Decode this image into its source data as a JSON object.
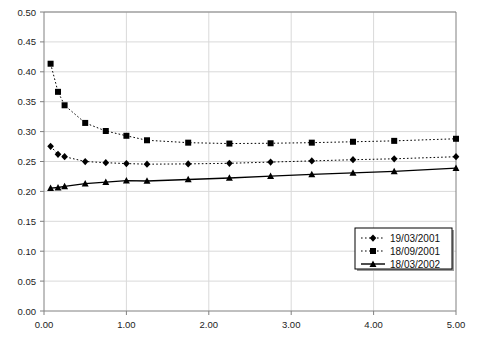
{
  "chart_data": {
    "type": "line",
    "title": "",
    "subtitle": "",
    "xlabel": "",
    "ylabel": "",
    "xlim": [
      0.0,
      5.0
    ],
    "ylim": [
      0.0,
      0.5
    ],
    "xticks": [
      0.0,
      1.0,
      2.0,
      3.0,
      4.0,
      5.0
    ],
    "xtick_labels": [
      "0.00",
      "1.00",
      "2.00",
      "3.00",
      "4.00",
      "5.00"
    ],
    "yticks": [
      0.0,
      0.05,
      0.1,
      0.15,
      0.2,
      0.25,
      0.3,
      0.35,
      0.4,
      0.45,
      0.5
    ],
    "ytick_labels": [
      "0.00",
      "0.05",
      "0.10",
      "0.15",
      "0.20",
      "0.25",
      "0.30",
      "0.35",
      "0.40",
      "0.45",
      "0.50"
    ],
    "grid": true,
    "grid_color": "#d9d9d9",
    "axis_color": "#808080",
    "series_color": "#000000",
    "legend_position": "bottom-right",
    "series": [
      {
        "name": "19/03/2001",
        "marker": "diamond",
        "linestyle": "dotted",
        "x": [
          0.08,
          0.17,
          0.25,
          0.5,
          0.75,
          1.0,
          1.25,
          1.75,
          2.25,
          2.75,
          3.25,
          3.75,
          4.25,
          5.0
        ],
        "values": [
          0.2755,
          0.262,
          0.258,
          0.25,
          0.248,
          0.2465,
          0.2455,
          0.246,
          0.247,
          0.249,
          0.251,
          0.253,
          0.2545,
          0.258
        ]
      },
      {
        "name": "18/09/2001",
        "marker": "square",
        "linestyle": "dotted",
        "x": [
          0.08,
          0.17,
          0.25,
          0.5,
          0.75,
          1.0,
          1.25,
          1.75,
          2.25,
          2.75,
          3.25,
          3.75,
          4.25,
          5.0
        ],
        "values": [
          0.4135,
          0.3665,
          0.344,
          0.3145,
          0.301,
          0.293,
          0.2855,
          0.2815,
          0.28,
          0.2805,
          0.2815,
          0.283,
          0.2845,
          0.288
        ]
      },
      {
        "name": "18/03/2002",
        "marker": "triangle",
        "linestyle": "solid",
        "x": [
          0.08,
          0.17,
          0.25,
          0.5,
          0.75,
          1.0,
          1.25,
          1.75,
          2.25,
          2.75,
          3.25,
          3.75,
          4.25,
          5.0
        ],
        "values": [
          0.2055,
          0.2065,
          0.2085,
          0.213,
          0.2155,
          0.218,
          0.2175,
          0.22,
          0.2225,
          0.2255,
          0.2285,
          0.231,
          0.2335,
          0.239
        ]
      }
    ],
    "legend": [
      {
        "label": "19/03/2001",
        "marker": "diamond",
        "linestyle": "dotted"
      },
      {
        "label": "18/09/2001",
        "marker": "square",
        "linestyle": "dotted"
      },
      {
        "label": "18/03/2002",
        "marker": "triangle",
        "linestyle": "solid"
      }
    ]
  }
}
